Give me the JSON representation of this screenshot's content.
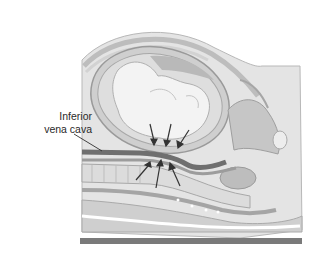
{
  "figure": {
    "labels": [
      {
        "line1": "Inferior",
        "line2": "vena cava"
      }
    ],
    "annotations": {
      "downward_arrows": 3,
      "upward_arrows": 3
    },
    "colors": {
      "background": "#ffffff",
      "skin_outer": "#e6e6e6",
      "uterus_wall": "#c9c9c9",
      "fetus": "#f1f1f1",
      "vessel_dark": "#6d6d6d",
      "spine": "#d8d8d8",
      "table": "#7a7a7a",
      "arrow": "#333333"
    }
  }
}
